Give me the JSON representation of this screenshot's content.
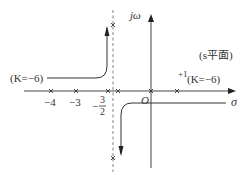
{
  "diagram": {
    "type": "root-locus",
    "plane_label": "(s平面)",
    "axes": {
      "real_axis_label": "σ",
      "imag_axis_label": "jω",
      "origin_label": "O"
    },
    "tick_labels": [
      {
        "id": "neg4",
        "text": "−4"
      },
      {
        "id": "neg3",
        "text": "−3"
      },
      {
        "id": "neg3half_num",
        "text": "3"
      },
      {
        "id": "neg3half_den",
        "text": "2"
      },
      {
        "id": "neg3half_sign",
        "text": "−"
      },
      {
        "id": "pos1",
        "text": "+1"
      }
    ],
    "annotations": {
      "left_gain": "(K=−6)",
      "right_gain": "(K=−6)"
    },
    "asymptote": {
      "x": -1.5,
      "style": "dashed"
    },
    "markers": [
      {
        "x": -4,
        "y": 0
      },
      {
        "x": -3,
        "y": 0
      },
      {
        "x": -1.7,
        "y": 0
      },
      {
        "x": -1.3,
        "y": 0
      },
      {
        "x": 0,
        "y": 0
      },
      {
        "x": 1,
        "y": 0
      },
      {
        "x": -1.5,
        "y": "upper"
      },
      {
        "x": -1.5,
        "y": "lower"
      }
    ],
    "colors": {
      "line": "#333333",
      "dashed": "#777777"
    }
  }
}
